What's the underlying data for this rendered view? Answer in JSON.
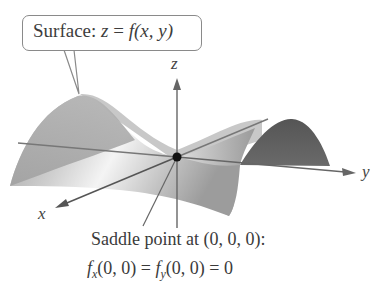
{
  "figure": {
    "callout": {
      "prefix": "Surface: ",
      "z": "z",
      "equals": " = ",
      "f": "f",
      "args": "(x, y)"
    },
    "axes": {
      "x_label": "x",
      "y_label": "y",
      "z_label": "z"
    },
    "saddle": {
      "line1": "Saddle point at (0, 0, 0):",
      "fx": "f",
      "fx_sub": "x",
      "fx_args": "(0, 0) = ",
      "fy": "f",
      "fy_sub": "y",
      "fy_args": "(0, 0) = 0"
    },
    "colors": {
      "surface_light": "#e6e6e6",
      "surface_mid": "#a9a9a9",
      "surface_dark": "#5e5e5e",
      "axis": "#6b6b6b",
      "point": "#111111"
    }
  }
}
